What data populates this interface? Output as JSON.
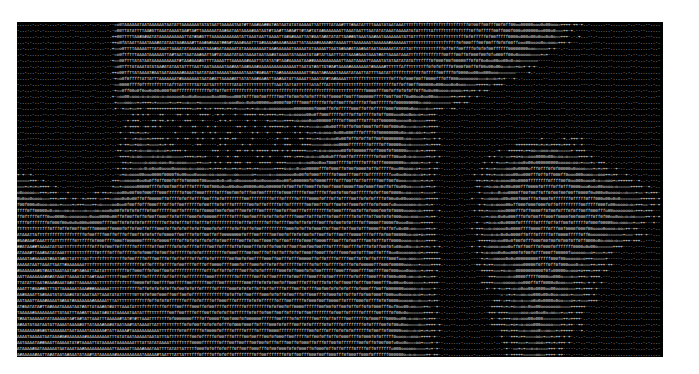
{
  "canvas": {
    "background": "#ffffff",
    "frame_background": "#000000",
    "text_color": "#e8e8e8"
  },
  "art": {
    "rows": 56,
    "cols": 258,
    "ramp": " .-+=o0fTA#",
    "grid_cols": 43,
    "grid": [
      "1111111888888888888888888877776665552211111",
      "1111111888888888888888888877776665552211111",
      "1111111788888888888888888877766665542111111",
      "1111111788888888888888888877666665421111111",
      "1111111788888888888888888876666554311111111",
      "1111111788888888888888888776666543111111111",
      "1111111678888888888888777666654431111111111",
      "1111111666777777777777766665543211111111111",
      "1111111544455556666666666655432111111111111",
      "1111111433333344556666666654321111111111111",
      "1111111222222222334566666543111111111111111",
      "1111111222222222233456666543111111111111111",
      "1111111232222222222345666543111111111111111",
      "1111111243222222222345666543111112222211111",
      "1111111344322222222345666543111123443211111",
      "1111111344433222223456666543111234554321111",
      "1111111345544333334566666543111345665432111",
      "3211111455655444445666666543112345665543211",
      "4321112456666555556666666543112456666554321",
      "5432223566666666666666666543112456666655432",
      "6543334566666666666666666543112456666665432",
      "6654445666666666666666666543112456666665432",
      "7665556666666666666666666543112456666665432",
      "7766666666666666666666666543112456666654321",
      "8877666666666666666666666543112456666654321",
      "8887766666666666666666666543112456666543211",
      "8888776666666666666666666543112456665432111",
      "8888877666666666666666666543112345665432111",
      "8888887666666666666666666543111345654321111",
      "8888887766666666666666666543111345654321111",
      "8888888766666666666666666543111234554321111",
      "8888888776666666666666666543111234554321111",
      "8888888877666666666666666543111234543211111",
      "8888888887666666666666666543111234543211111",
      "8888888888766666666666666543111234543211111",
      "8888888888766666666666666543111123432111111",
      "8888888888776666666666666543111123432111111",
      "8888888888876666666666666543111123432111111"
    ]
  }
}
